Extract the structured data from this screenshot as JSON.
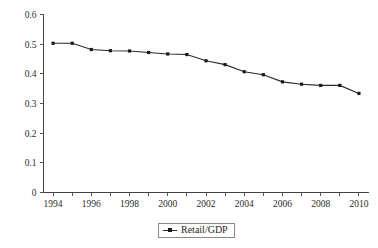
{
  "chart_data": {
    "type": "line",
    "title": "",
    "subtitle": "",
    "xlabel": "",
    "ylabel": "",
    "xlim": [
      1993.5,
      2010.5
    ],
    "ylim": [
      0,
      0.6
    ],
    "grid": false,
    "legend_position": "bottom-center",
    "x": [
      1994,
      1995,
      1996,
      1997,
      1998,
      1999,
      2000,
      2001,
      2002,
      2003,
      2004,
      2005,
      2006,
      2007,
      2008,
      2009,
      2010
    ],
    "x_tick_labels": [
      "1994",
      "1996",
      "1998",
      "2000",
      "2002",
      "2004",
      "2006",
      "2008",
      "2010"
    ],
    "x_tick_values": [
      1994,
      1996,
      1998,
      2000,
      2002,
      2004,
      2006,
      2008,
      2010
    ],
    "x_minor_tick_values": [
      1995,
      1997,
      1999,
      2001,
      2003,
      2005,
      2007,
      2009
    ],
    "y_tick_labels": [
      "0",
      "0.1",
      "0.2",
      "0.3",
      "0.4",
      "0.5",
      "0.6"
    ],
    "y_tick_values": [
      0,
      0.1,
      0.2,
      0.3,
      0.4,
      0.5,
      0.6
    ],
    "series": [
      {
        "name": "Retail/GDP",
        "color": "#2a2a2a",
        "marker": "square",
        "values": [
          0.503,
          0.503,
          0.482,
          0.478,
          0.477,
          0.472,
          0.467,
          0.465,
          0.444,
          0.431,
          0.407,
          0.397,
          0.373,
          0.365,
          0.361,
          0.361,
          0.334
        ]
      }
    ]
  },
  "legend": {
    "entries": [
      {
        "label": "Retail/GDP",
        "marker_icon": "line-with-square-marker"
      }
    ]
  }
}
